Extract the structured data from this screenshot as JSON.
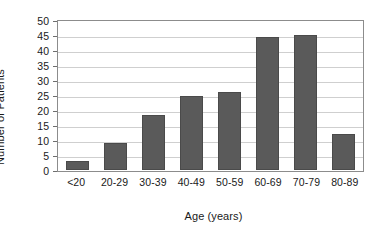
{
  "chart_data": {
    "type": "bar",
    "title": "",
    "xlabel": "Age (years)",
    "ylabel": "Number of Patients",
    "categories": [
      "<20",
      "20-29",
      "30-39",
      "40-49",
      "50-59",
      "60-69",
      "70-79",
      "80-89"
    ],
    "values": [
      3,
      9,
      18.5,
      25,
      26.5,
      45,
      45.5,
      12
    ],
    "series": [
      {
        "name": "Number of Patients",
        "values": [
          3,
          9,
          18.5,
          25,
          26.5,
          45,
          45.5,
          12
        ]
      }
    ],
    "ylim": [
      0,
      50
    ],
    "ytick_labels": [
      "0",
      "5",
      "10",
      "15",
      "20",
      "25",
      "30",
      "35",
      "40",
      "45",
      "50"
    ],
    "ytick_values": [
      0,
      5,
      10,
      15,
      20,
      25,
      30,
      35,
      40,
      45,
      50
    ],
    "grid": "horizontal",
    "legend": "none",
    "bar_color": "#5a5a5a",
    "gridline_color": "#cfcfcf",
    "axis_color": "#8c8c8c",
    "background_color": "#ffffff"
  }
}
